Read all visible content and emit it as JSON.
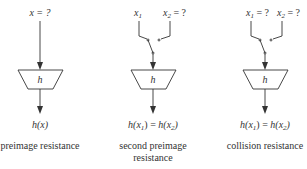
{
  "diagrams": [
    {
      "id": "preimage",
      "inputs": [
        {
          "label": "x = ?"
        }
      ],
      "function_label": "h",
      "output_label": "h(x)",
      "caption": [
        "preimage resistance"
      ]
    },
    {
      "id": "second-preimage",
      "inputs": [
        {
          "var": "x",
          "sub": "1",
          "suffix": ""
        },
        {
          "var": "x",
          "sub": "2",
          "suffix": " = ?"
        }
      ],
      "function_label": "h",
      "output": {
        "lhs": "h(x",
        "lhs_sub": "1",
        "rhs": "h(x",
        "rhs_sub": "2",
        "eq": ") = ",
        "close": ")"
      },
      "caption": [
        "second preimage",
        "resistance"
      ]
    },
    {
      "id": "collision",
      "inputs": [
        {
          "var": "x",
          "sub": "1",
          "suffix": " = ?"
        },
        {
          "var": "x",
          "sub": "2",
          "suffix": " = ?"
        }
      ],
      "function_label": "h",
      "output": {
        "lhs": "h(x",
        "lhs_sub": "1",
        "rhs": "h(x",
        "rhs_sub": "2",
        "eq": ") = ",
        "close": ")"
      },
      "caption": [
        "collision resistance"
      ]
    }
  ],
  "colors": {
    "stroke": "#333333",
    "background": "#ffffff"
  }
}
